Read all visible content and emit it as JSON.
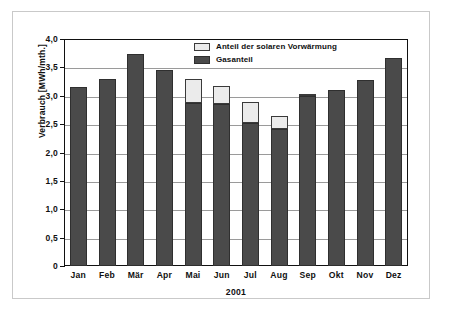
{
  "chart_data": {
    "type": "bar",
    "stacked": true,
    "title": "",
    "xlabel": "2001",
    "ylabel": "Verbrauch [MWh/mth.]",
    "ylim": [
      0,
      4.0
    ],
    "ytick_labels": [
      "4,0",
      "3,5",
      "3,0",
      "2,5",
      "2,0",
      "1,5",
      "1,0",
      "0,5",
      "0"
    ],
    "ytick_values": [
      4.0,
      3.5,
      3.0,
      2.5,
      2.0,
      1.5,
      1.0,
      0.5,
      0
    ],
    "grid": true,
    "legend_position": "top-center",
    "categories": [
      "Jan",
      "Feb",
      "Mär",
      "Apr",
      "Mai",
      "Jun",
      "Jul",
      "Aug",
      "Sep",
      "Okt",
      "Nov",
      "Dez"
    ],
    "series": [
      {
        "name": "Gasanteil",
        "color": "#4a4a4a",
        "values": [
          3.15,
          3.29,
          3.73,
          3.45,
          2.88,
          2.85,
          2.52,
          2.41,
          3.0,
          3.1,
          3.28,
          3.66
        ]
      },
      {
        "name": "Anteil der solaren Vorwärmung",
        "color": "#ebebeb",
        "values": [
          0,
          0,
          0,
          0,
          0.42,
          0.32,
          0.37,
          0.24,
          0.02,
          0,
          0,
          0
        ]
      }
    ],
    "totals": [
      3.15,
      3.29,
      3.73,
      3.45,
      3.3,
      3.17,
      2.89,
      2.65,
      3.02,
      3.1,
      3.28,
      3.66
    ]
  },
  "legend": {
    "items": [
      {
        "label": "Anteil der solaren Vorwärmung"
      },
      {
        "label": "Gasanteil"
      }
    ]
  }
}
